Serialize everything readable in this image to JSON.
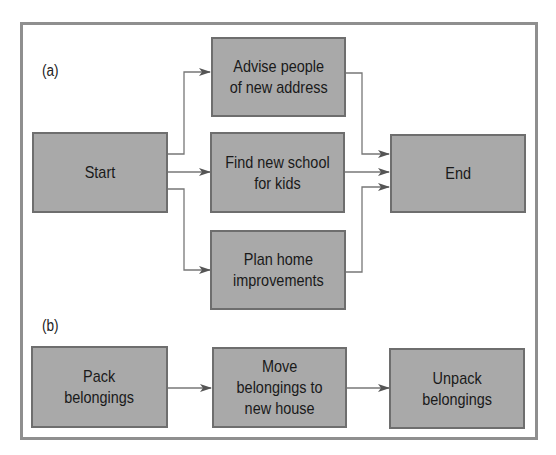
{
  "diagram": {
    "part_a": {
      "label": "(a)",
      "nodes": {
        "start": "Start",
        "advise": "Advise people\nof new address",
        "find_school": "Find new school\nfor kids",
        "plan_home": "Plan home\nimprovements",
        "end": "End"
      },
      "edges": [
        [
          "Start",
          "Advise people of new address"
        ],
        [
          "Start",
          "Find new school for kids"
        ],
        [
          "Start",
          "Plan home improvements"
        ],
        [
          "Advise people of new address",
          "End"
        ],
        [
          "Find new school for kids",
          "End"
        ],
        [
          "Plan home improvements",
          "End"
        ]
      ]
    },
    "part_b": {
      "label": "(b)",
      "nodes": {
        "pack": "Pack\nbelongings",
        "move": "Move\nbelongings to\nnew house",
        "unpack": "Unpack\nbelongings"
      },
      "edges": [
        [
          "Pack belongings",
          "Move belongings to new house"
        ],
        [
          "Move belongings to new house",
          "Unpack belongings"
        ]
      ]
    },
    "colors": {
      "box_fill": "#a9a9a9",
      "box_border": "#6e6e6e",
      "frame": "#8f8f8f",
      "arrow": "#555555"
    }
  }
}
